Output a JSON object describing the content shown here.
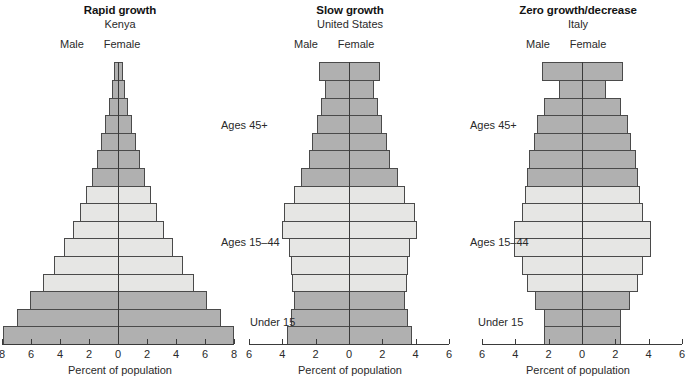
{
  "figure": {
    "axis_title": "Percent of population",
    "age_groups": [
      "Ages 45+",
      "Ages 15–44",
      "Under 15"
    ],
    "sex_labels": {
      "male": "Male",
      "female": "Female"
    },
    "colors": {
      "dark_band": "#b0b0b0",
      "light_band": "#e6e6e4",
      "outline": "#4a4a4a",
      "axis": "#3a3a3a",
      "text": "#2a2a2a",
      "background": "#ffffff"
    }
  },
  "chart_data": [
    {
      "type": "bar",
      "title": "Rapid growth",
      "subtitle": "Kenya",
      "xlabel": "Percent of population",
      "ylabel": "",
      "xlim": [
        -8,
        8
      ],
      "xticks": [
        8,
        6,
        4,
        2,
        0,
        2,
        4,
        6,
        8
      ],
      "grid": false,
      "legend": "none",
      "bands": [
        {
          "label": "Under 15",
          "rows": [
            0,
            1,
            2
          ],
          "shade": "dark"
        },
        {
          "label": "Ages 15–44",
          "rows": [
            3,
            4,
            5,
            6,
            7,
            8
          ],
          "shade": "light"
        },
        {
          "label": "Ages 45+",
          "rows": [
            9,
            10,
            11,
            12,
            13,
            14,
            15
          ],
          "shade": "dark"
        }
      ],
      "categories": [
        "0–4",
        "5–9",
        "10–14",
        "15–19",
        "20–24",
        "25–29",
        "30–34",
        "35–39",
        "40–44",
        "45–49",
        "50–54",
        "55–59",
        "60–64",
        "65–69",
        "70–74",
        "75+"
      ],
      "series": [
        {
          "name": "Male",
          "values": [
            7.9,
            7.0,
            6.1,
            5.2,
            4.4,
            3.7,
            3.1,
            2.6,
            2.2,
            1.8,
            1.45,
            1.15,
            0.9,
            0.62,
            0.42,
            0.28
          ]
        },
        {
          "name": "Female",
          "values": [
            7.9,
            7.0,
            6.1,
            5.2,
            4.4,
            3.7,
            3.1,
            2.6,
            2.2,
            1.8,
            1.45,
            1.15,
            0.9,
            0.62,
            0.42,
            0.28
          ]
        }
      ]
    },
    {
      "type": "bar",
      "title": "Slow growth",
      "subtitle": "United States",
      "xlabel": "Percent of population",
      "ylabel": "",
      "xlim": [
        -6,
        6
      ],
      "xticks": [
        6,
        4,
        2,
        0,
        2,
        4,
        6
      ],
      "grid": false,
      "legend": "none",
      "bands": [
        {
          "label": "Under 15",
          "rows": [
            0,
            1,
            2
          ],
          "shade": "dark"
        },
        {
          "label": "Ages 15–44",
          "rows": [
            3,
            4,
            5,
            6,
            7,
            8
          ],
          "shade": "light"
        },
        {
          "label": "Ages 45+",
          "rows": [
            9,
            10,
            11,
            12,
            13,
            14,
            15
          ],
          "shade": "dark"
        }
      ],
      "categories": [
        "0–4",
        "5–9",
        "10–14",
        "15–19",
        "20–24",
        "25–29",
        "30–34",
        "35–39",
        "40–44",
        "45–49",
        "50–54",
        "55–59",
        "60–64",
        "65–69",
        "70–74",
        "75+"
      ],
      "series": [
        {
          "name": "Male",
          "values": [
            3.7,
            3.5,
            3.3,
            3.4,
            3.5,
            3.6,
            4.0,
            3.9,
            3.3,
            2.9,
            2.4,
            2.2,
            1.9,
            1.7,
            1.45,
            1.8
          ]
        },
        {
          "name": "Female",
          "values": [
            3.7,
            3.5,
            3.3,
            3.4,
            3.5,
            3.6,
            4.0,
            3.9,
            3.3,
            2.9,
            2.4,
            2.2,
            1.9,
            1.7,
            1.45,
            1.8
          ]
        }
      ]
    },
    {
      "type": "bar",
      "title": "Zero growth/decrease",
      "subtitle": "Italy",
      "xlabel": "Percent of population",
      "ylabel": "",
      "xlim": [
        -6,
        6
      ],
      "xticks": [
        6,
        4,
        2,
        0,
        2,
        4,
        6
      ],
      "grid": false,
      "legend": "none",
      "bands": [
        {
          "label": "Under 15",
          "rows": [
            0,
            1,
            2
          ],
          "shade": "dark"
        },
        {
          "label": "Ages 15–44",
          "rows": [
            3,
            4,
            5,
            6,
            7,
            8
          ],
          "shade": "light"
        },
        {
          "label": "Ages 45+",
          "rows": [
            9,
            10,
            11,
            12,
            13,
            14,
            15
          ],
          "shade": "dark"
        }
      ],
      "categories": [
        "0–4",
        "5–9",
        "10–14",
        "15–19",
        "20–24",
        "25–29",
        "30–34",
        "35–39",
        "40–44",
        "45–49",
        "50–54",
        "55–59",
        "60–64",
        "65–69",
        "70–74",
        "75+"
      ],
      "series": [
        {
          "name": "Male",
          "values": [
            2.3,
            2.3,
            2.8,
            3.3,
            3.6,
            4.1,
            4.1,
            3.6,
            3.4,
            3.3,
            3.2,
            2.9,
            2.7,
            2.3,
            1.4,
            2.4
          ]
        },
        {
          "name": "Female",
          "values": [
            2.3,
            2.3,
            2.8,
            3.3,
            3.6,
            4.1,
            4.1,
            3.6,
            3.4,
            3.3,
            3.2,
            2.9,
            2.7,
            2.3,
            1.4,
            2.4
          ]
        }
      ]
    }
  ],
  "annotations": {
    "left_of_panel2": [
      "Ages 45+",
      "Ages 15–44",
      "Under 15"
    ],
    "left_of_panel3": [
      "Ages 45+",
      "Ages 15–44",
      "Under 15"
    ]
  }
}
